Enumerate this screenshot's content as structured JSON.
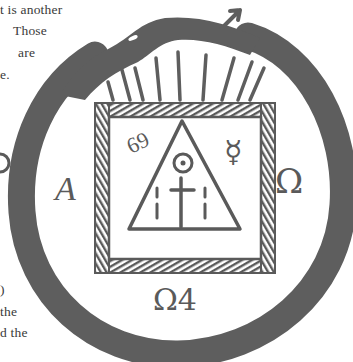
{
  "page": {
    "text_fragments_top": [
      {
        "text": "t is another",
        "x": 0,
        "y": 3
      },
      {
        "text": "Those",
        "x": 13,
        "y": 24
      },
      {
        "text": "are",
        "x": 18,
        "y": 46
      },
      {
        "text": "e.",
        "x": 0,
        "y": 68
      }
    ],
    "text_fragments_bottom": [
      {
        "text": ")",
        "x": 0,
        "y": 283
      },
      {
        "text": "the",
        "x": 0,
        "y": 305
      },
      {
        "text": "d the",
        "x": 0,
        "y": 326
      }
    ]
  },
  "figure": {
    "ink_color": "#5a5a5a",
    "symbols": {
      "left_letter": "A",
      "right_letter": "Ω",
      "number_top_left": "69",
      "mercury_symbol": "☿",
      "bottom_label": "Ω4"
    }
  }
}
